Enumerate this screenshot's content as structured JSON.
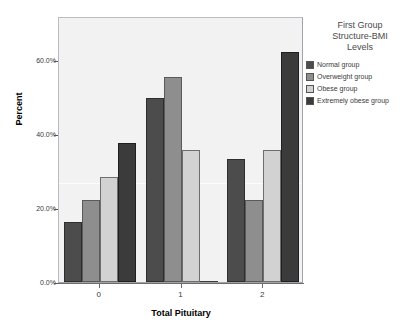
{
  "chart_data": {
    "type": "bar",
    "title": "",
    "xlabel": "Total Pituitary",
    "ylabel": "Percent",
    "categories": [
      "0",
      "1",
      "2"
    ],
    "x_tick_labels": [
      "0",
      "1",
      "2"
    ],
    "y_tick_labels": [
      "0.0%",
      "20.0%",
      "40.0%",
      "60.0%"
    ],
    "y_tick_values": [
      0,
      20,
      40,
      60
    ],
    "ylim": [
      0,
      72
    ],
    "grid": false,
    "legend_position": "right",
    "legend_title": "First Group\nStructure-BMI\nLevels",
    "series": [
      {
        "name": "Normal group",
        "color": "#4c4c4c",
        "values": [
          16.3,
          49.8,
          33.2
        ]
      },
      {
        "name": "Overweight group",
        "color": "#8e8e8e",
        "values": [
          22.2,
          55.4,
          22.1
        ]
      },
      {
        "name": "Obese group",
        "color": "#d2d2d2",
        "values": [
          28.3,
          35.6,
          35.6
        ]
      },
      {
        "name": "Extremely obese group",
        "color": "#3b3b3b",
        "values": [
          37.5,
          0.0,
          62.2
        ]
      }
    ]
  },
  "axes": {
    "y_title": "Percent",
    "x_title": "Total Pituitary"
  },
  "legend": {
    "title": "First Group\nStructure-BMI\nLevels",
    "items": [
      {
        "label": "Normal group",
        "color": "#4c4c4c"
      },
      {
        "label": "Overweight group",
        "color": "#8e8e8e"
      },
      {
        "label": "Obese group",
        "color": "#d2d2d2"
      },
      {
        "label": "Extremely obese group",
        "color": "#3b3b3b"
      }
    ]
  }
}
